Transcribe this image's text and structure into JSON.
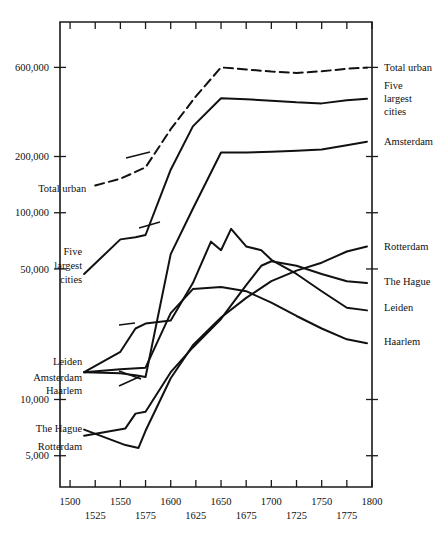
{
  "chart_data": {
    "type": "line",
    "title": "",
    "subtitle": "",
    "xlabel": "",
    "ylabel": "",
    "yscale": "log",
    "xlim": [
      1490,
      1800
    ],
    "ylim": [
      3400,
      1050000
    ],
    "grid": false,
    "legend_position": "inline-right-and-left-annotations",
    "y_tick_labels": [
      "600,000",
      "200,000",
      "100,000",
      "50,000",
      "10,000",
      "5,000"
    ],
    "y_tick_values": [
      600000,
      200000,
      100000,
      50000,
      10000,
      5000
    ],
    "x_tick_values": [
      1500,
      1525,
      1550,
      1575,
      1600,
      1625,
      1650,
      1675,
      1700,
      1725,
      1750,
      1775,
      1800
    ],
    "x_tick_labels_upper": [
      "1500",
      "1550",
      "1600",
      "1650",
      "1700",
      "1750",
      "1800"
    ],
    "x_tick_labels_upper_values": [
      1500,
      1550,
      1600,
      1650,
      1700,
      1750,
      1800
    ],
    "x_tick_labels_lower": [
      "1525",
      "1575",
      "1625",
      "1675",
      "1725",
      "1775"
    ],
    "x_tick_labels_lower_values": [
      1525,
      1575,
      1625,
      1675,
      1725,
      1775
    ],
    "series": [
      {
        "name": "Total urban",
        "style": "dashed",
        "label_left": "Total urban",
        "label_right": "Total urban",
        "x": [
          1525,
          1550,
          1575,
          1600,
          1625,
          1650,
          1675,
          1700,
          1725,
          1750,
          1775,
          1795
        ],
        "values": [
          140000,
          152000,
          175000,
          280000,
          420000,
          600000,
          585000,
          570000,
          560000,
          572000,
          590000,
          598000
        ]
      },
      {
        "name": "Five largest cities",
        "style": "solid",
        "label_left": "Five largest cities",
        "label_right": "Five largest cities",
        "x": [
          1514,
          1550,
          1565,
          1575,
          1600,
          1622,
          1650,
          1675,
          1700,
          1725,
          1750,
          1775,
          1795
        ],
        "values": [
          47000,
          72000,
          74000,
          76000,
          170000,
          290000,
          410000,
          405000,
          398000,
          390000,
          385000,
          400000,
          408000
        ]
      },
      {
        "name": "Amsterdam",
        "style": "solid",
        "label_left": "Amsterdam",
        "label_right": "Amsterdam",
        "x": [
          1514,
          1550,
          1565,
          1575,
          1600,
          1622,
          1650,
          1675,
          1700,
          1725,
          1750,
          1775,
          1795
        ],
        "values": [
          14000,
          13800,
          13500,
          13200,
          60000,
          105000,
          210000,
          210000,
          212000,
          215000,
          218000,
          230000,
          240000
        ]
      },
      {
        "name": "Leiden",
        "style": "solid",
        "label_left": "Leiden",
        "label_right": "Leiden",
        "x": [
          1514,
          1550,
          1565,
          1575,
          1600,
          1622,
          1640,
          1650,
          1660,
          1675,
          1690,
          1700,
          1725,
          1750,
          1775,
          1795
        ],
        "values": [
          14000,
          18000,
          24000,
          25500,
          26500,
          42000,
          70000,
          63000,
          82000,
          66000,
          63000,
          56000,
          47000,
          38000,
          31000,
          30000
        ]
      },
      {
        "name": "Haarlem",
        "style": "solid",
        "label_left": "Haarlem",
        "label_right": "Haarlem",
        "x": [
          1514,
          1550,
          1575,
          1600,
          1622,
          1650,
          1675,
          1700,
          1725,
          1750,
          1775,
          1795
        ],
        "values": [
          14000,
          14500,
          14800,
          29000,
          39000,
          40000,
          38000,
          33000,
          28000,
          24000,
          21000,
          20000
        ]
      },
      {
        "name": "The Hague",
        "style": "solid",
        "label_left": "The Hague",
        "label_right": "The Hague",
        "x": [
          1514,
          1555,
          1565,
          1575,
          1600,
          1622,
          1650,
          1675,
          1690,
          1700,
          1725,
          1750,
          1775,
          1795
        ],
        "values": [
          6400,
          7000,
          8400,
          8600,
          14000,
          19000,
          27000,
          41000,
          52000,
          55000,
          52000,
          47000,
          43000,
          42000
        ]
      },
      {
        "name": "Rotterdam",
        "style": "solid",
        "label_left": "Rotterdam",
        "label_right": "Rotterdam",
        "x": [
          1514,
          1555,
          1568,
          1575,
          1600,
          1622,
          1650,
          1675,
          1700,
          1725,
          1750,
          1775,
          1795
        ],
        "values": [
          6900,
          5700,
          5500,
          6800,
          13000,
          19500,
          27500,
          35000,
          43000,
          49000,
          54000,
          62000,
          66000
        ]
      }
    ],
    "left_annotations": [
      {
        "text": "Total urban",
        "x": 1516,
        "y": 135000
      },
      {
        "text": "Five",
        "x": 1512,
        "y": 62000
      },
      {
        "text": "largest",
        "x": 1512,
        "y": 52000
      },
      {
        "text": "cities",
        "x": 1512,
        "y": 44000
      },
      {
        "text": "Leiden",
        "x": 1512,
        "y": 16000
      },
      {
        "text": "Amsterdam",
        "x": 1512,
        "y": 13200
      },
      {
        "text": "Haarlem",
        "x": 1512,
        "y": 11200
      },
      {
        "text": "The Hague",
        "x": 1512,
        "y": 7000
      },
      {
        "text": "Rotterdam",
        "x": 1512,
        "y": 5600
      }
    ],
    "right_annotations": [
      {
        "text": "Total urban",
        "y": 600000
      },
      {
        "text": "Five",
        "y": 480000
      },
      {
        "text": "largest",
        "y": 410000
      },
      {
        "text": "cities",
        "y": 350000
      },
      {
        "text": "Amsterdam",
        "y": 240000
      },
      {
        "text": "Rotterdam",
        "y": 66000
      },
      {
        "text": "The Hague",
        "y": 43000
      },
      {
        "text": "Leiden",
        "y": 31000
      },
      {
        "text": "Haarlem",
        "y": 20500
      }
    ],
    "colors": {
      "line": "#111111",
      "axis": "#1a1a1a",
      "text": "#111111",
      "background": "#ffffff"
    }
  }
}
